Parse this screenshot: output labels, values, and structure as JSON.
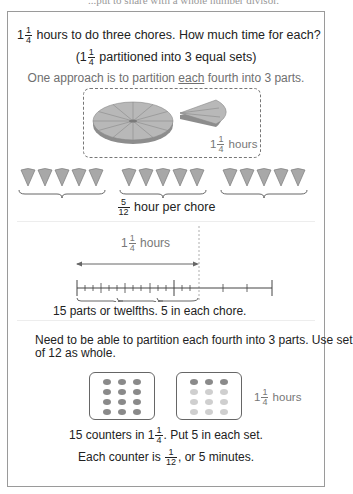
{
  "page": {
    "top_cutoff_text": "...put to share with a whole number divisor.",
    "colors": {
      "text": "#222222",
      "gray_text": "#6f6f6f",
      "wedge_fill": "#a8a8a8",
      "dot_dark": "#8a8a8a",
      "dot_light": "#cfcfcf",
      "frame_border": "#9a9a9a"
    }
  },
  "panel1": {
    "title_whole": "1",
    "title_num": "1",
    "title_den": "4",
    "title_text": " hours to do three chores. How much time for each?",
    "subtitle_open": "(1",
    "subtitle_num": "1",
    "subtitle_den": "4",
    "subtitle_text": " partitioned into 3 equal sets)",
    "approach_pre": "One approach is to partition ",
    "approach_emph": "each",
    "approach_post": " fourth into 3 parts.",
    "pie_label_whole": "1",
    "pie_label_num": "1",
    "pie_label_den": "4",
    "pie_label_text": " hours",
    "groups": [
      {
        "wedges": 5
      },
      {
        "wedges": 5
      },
      {
        "wedges": 5
      }
    ],
    "result_num": "5",
    "result_den": "12",
    "result_text": " hour per chore"
  },
  "panel2": {
    "arrow_label_whole": "1",
    "arrow_label_num": "1",
    "arrow_label_den": "4",
    "arrow_label_text": " hours",
    "caption": "15 parts or twelfths. 5 in each chore."
  },
  "panel3": {
    "intro_line1": "Need to be able to partition each fourth into 3 parts.  Use set",
    "intro_line2": "of 12 as whole.",
    "set_label_whole": "1",
    "set_label_num": "1",
    "set_label_den": "4",
    "set_label_text": " hours",
    "line1_pre": "15 counters in 1",
    "line1_num": "1",
    "line1_den": "4",
    "line1_post": ". Put 5 in each set.",
    "line2_pre": "Each counter is ",
    "line2_num": "1",
    "line2_den": "12",
    "line2_post": ", or 5 minutes."
  }
}
